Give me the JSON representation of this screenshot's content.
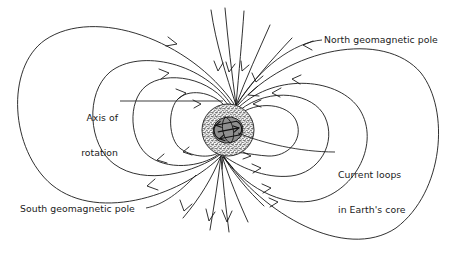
{
  "figure": {
    "type": "diagram",
    "background_color": "#ffffff",
    "line_color": "#1a1a1a",
    "mantle_color": "#d9d9d9",
    "core_color": "#8c8c8c"
  },
  "labels": {
    "north_pole": {
      "text": "North geomagnetic pole",
      "x": 324,
      "y": 35
    },
    "axis_of_rotation": {
      "line1": "Axis of",
      "line2": "rotation",
      "x": 71,
      "y": 95
    },
    "current_loops": {
      "line1": "Current loops",
      "line2": "in Earth's core",
      "x": 337,
      "y": 149
    },
    "south_pole": {
      "text": "South geomagnetic pole",
      "x": 20,
      "y": 205
    }
  },
  "earth": {
    "center_x": 228,
    "center_y": 130,
    "mantle_radius": 26,
    "core_radius_x": 15,
    "core_radius_y": 13,
    "tilt_degrees": -11,
    "current_loop_count": 3
  },
  "field": {
    "left_loop_count": 4,
    "right_loop_count": 4,
    "polar_line_count_north": 6,
    "polar_line_count_south": 6,
    "north_pole_point_x": 236,
    "north_pole_point_y": 106,
    "south_pole_point_x": 221,
    "south_pole_point_y": 155
  }
}
